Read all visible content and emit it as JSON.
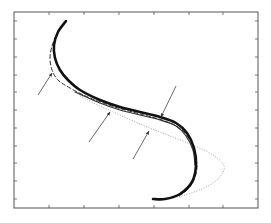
{
  "chart_data": {
    "type": "line",
    "title": "",
    "xlabel": "",
    "ylabel": "",
    "grid": false,
    "legend": null,
    "frame": {
      "left": 14,
      "top": 12,
      "right": 258,
      "bottom": 208,
      "color": "#555555"
    },
    "x_ticks_px": [
      49,
      84,
      119,
      154,
      189,
      223
    ],
    "y_ticks_px": [
      21,
      39,
      57,
      75,
      92,
      110,
      128,
      146,
      163,
      181,
      199
    ],
    "tick_labels": [],
    "series": [
      {
        "name": "thick-solid-curve",
        "style": "solid",
        "color": "#111111",
        "width": 2.6,
        "points": [
          [
            66,
            21
          ],
          [
            58,
            32
          ],
          [
            54,
            45
          ],
          [
            55,
            58
          ],
          [
            60,
            70
          ],
          [
            68,
            80
          ],
          [
            80,
            90
          ],
          [
            100,
            100
          ],
          [
            120,
            107
          ],
          [
            140,
            112
          ],
          [
            160,
            117
          ],
          [
            176,
            123
          ],
          [
            187,
            133
          ],
          [
            194,
            148
          ],
          [
            196,
            165
          ],
          [
            192,
            182
          ],
          [
            180,
            194
          ],
          [
            165,
            199
          ],
          [
            153,
            199
          ]
        ]
      },
      {
        "name": "thin-solid-curve",
        "style": "solid",
        "color": "#333333",
        "width": 1.2,
        "points": [
          [
            75,
            92
          ],
          [
            100,
            103
          ],
          [
            120,
            110
          ],
          [
            140,
            115
          ],
          [
            160,
            120
          ],
          [
            176,
            126
          ],
          [
            186,
            136
          ],
          [
            193,
            150
          ],
          [
            195,
            165
          ]
        ]
      },
      {
        "name": "dashed-curve",
        "style": "dashed",
        "color": "#333333",
        "width": 1.0,
        "points": [
          [
            56,
            36
          ],
          [
            52,
            46
          ],
          [
            50,
            58
          ],
          [
            52,
            70
          ],
          [
            58,
            80
          ],
          [
            70,
            88
          ],
          [
            90,
            98
          ],
          [
            115,
            107
          ],
          [
            140,
            114
          ],
          [
            165,
            121
          ],
          [
            182,
            130
          ],
          [
            192,
            145
          ],
          [
            197,
            165
          ],
          [
            193,
            182
          ],
          [
            182,
            194
          ],
          [
            165,
            199
          ]
        ]
      },
      {
        "name": "dotted-curve",
        "style": "dotted",
        "color": "#999999",
        "width": 0.9,
        "points": [
          [
            80,
            96
          ],
          [
            100,
            106
          ],
          [
            120,
            115
          ],
          [
            145,
            126
          ],
          [
            170,
            136
          ],
          [
            195,
            146
          ],
          [
            213,
            155
          ],
          [
            224,
            166
          ],
          [
            219,
            178
          ],
          [
            204,
            188
          ],
          [
            185,
            195
          ],
          [
            168,
            199
          ]
        ]
      }
    ],
    "annotations": [
      {
        "type": "arrow",
        "from": [
          38,
          95
        ],
        "to": [
          52,
          73
        ]
      },
      {
        "type": "arrow",
        "from": [
          89,
          142
        ],
        "to": [
          110,
          112
        ]
      },
      {
        "type": "arrow",
        "from": [
          133,
          159
        ],
        "to": [
          149,
          131
        ]
      },
      {
        "type": "arrow",
        "from": [
          176,
          86
        ],
        "to": [
          161,
          117
        ]
      }
    ]
  }
}
